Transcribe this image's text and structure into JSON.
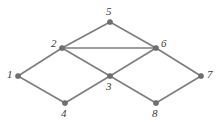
{
  "diagram": {
    "type": "node-link-graph",
    "background_color": "#ffffff",
    "edge_color": "#7d7d7d",
    "vertex_color": "#6f6f6f",
    "label_color": "#3a3a3a",
    "width": 218,
    "height": 125,
    "vertices": [
      {
        "id": "1",
        "label": "1",
        "x": 18,
        "y": 76,
        "label_x": 7,
        "label_y": 69
      },
      {
        "id": "2",
        "label": "2",
        "x": 62,
        "y": 48,
        "label_x": 51,
        "label_y": 38
      },
      {
        "id": "3",
        "label": "3",
        "x": 110,
        "y": 76,
        "label_x": 106,
        "label_y": 81
      },
      {
        "id": "4",
        "label": "4",
        "x": 65,
        "y": 103,
        "label_x": 61,
        "label_y": 108
      },
      {
        "id": "5",
        "label": "5",
        "x": 110,
        "y": 22,
        "label_x": 106,
        "label_y": 6
      },
      {
        "id": "6",
        "label": "6",
        "x": 156,
        "y": 48,
        "label_x": 161,
        "label_y": 38
      },
      {
        "id": "7",
        "label": "7",
        "x": 201,
        "y": 76,
        "label_x": 207,
        "label_y": 69
      },
      {
        "id": "8",
        "label": "8",
        "x": 156,
        "y": 103,
        "label_x": 152,
        "label_y": 108
      }
    ],
    "edges": [
      {
        "from": "1",
        "to": "2"
      },
      {
        "from": "1",
        "to": "4"
      },
      {
        "from": "2",
        "to": "5"
      },
      {
        "from": "2",
        "to": "6"
      },
      {
        "from": "2",
        "to": "3"
      },
      {
        "from": "4",
        "to": "3"
      },
      {
        "from": "5",
        "to": "6"
      },
      {
        "from": "3",
        "to": "6"
      },
      {
        "from": "3",
        "to": "8"
      },
      {
        "from": "6",
        "to": "7"
      },
      {
        "from": "8",
        "to": "7"
      }
    ]
  }
}
